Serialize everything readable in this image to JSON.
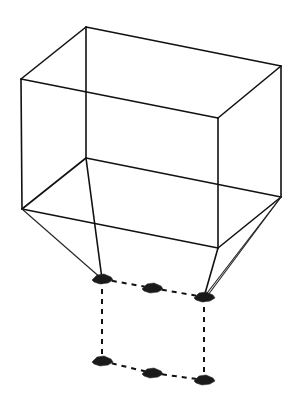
{
  "diagram": {
    "colors": {
      "background": "#ffffff",
      "line": "#111111",
      "marker": "#1a1a1a"
    },
    "box": {
      "front_top_left": [
        21,
        79
      ],
      "front_top_right": [
        218,
        118
      ],
      "front_bottom_left": [
        22,
        209
      ],
      "front_bottom_right": [
        218,
        248
      ],
      "back_top_left": [
        86,
        27
      ],
      "back_top_right": [
        281,
        66
      ],
      "back_bottom_left": [
        86,
        158
      ],
      "back_bottom_right": [
        281,
        197
      ]
    },
    "markers": [
      {
        "name": "top-left",
        "pos": [
          102,
          279
        ]
      },
      {
        "name": "top-middle",
        "pos": [
          152,
          288
        ]
      },
      {
        "name": "top-right",
        "pos": [
          204,
          297
        ]
      },
      {
        "name": "bottom-left",
        "pos": [
          102,
          361
        ]
      },
      {
        "name": "bottom-middle",
        "pos": [
          152,
          373
        ]
      },
      {
        "name": "bottom-right",
        "pos": [
          204,
          380
        ]
      }
    ]
  }
}
